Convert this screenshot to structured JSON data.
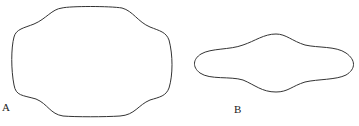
{
  "figures": [
    {
      "id": "A",
      "label": "A",
      "description": "rounded rectangular outline with concave waists"
    },
    {
      "id": "B",
      "label": "B",
      "description": "elongated lens-shaped outline with bulged center"
    }
  ],
  "colors": {
    "stroke": "#333333",
    "background": "#ffffff"
  }
}
